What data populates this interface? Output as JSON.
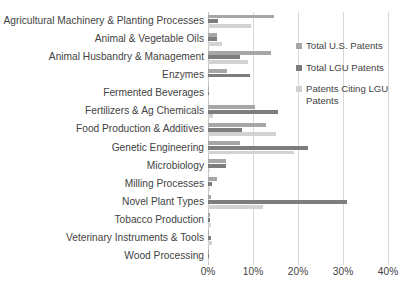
{
  "chart_data": {
    "type": "bar",
    "orientation": "horizontal",
    "title": "",
    "xlabel": "",
    "ylabel": "",
    "xlim": [
      0,
      40
    ],
    "xunit": "%",
    "grid": true,
    "legend_position": "right",
    "xticks": [
      "0%",
      "10%",
      "20%",
      "30%",
      "40%"
    ],
    "xtick_values": [
      0,
      10,
      20,
      30,
      40
    ],
    "categories": [
      "Agricultural Machinery & Planting Processes",
      "Animal & Vegetable Oils",
      "Animal Husbandry & Management",
      "Enzymes",
      "Fermented Beverages",
      "Fertilizers & Ag Chemicals",
      "Food Production & Additives",
      "Genetic Engineering",
      "Microbiology",
      "Milling Processes",
      "Novel Plant Types",
      "Tobacco Production",
      "Veterinary Instruments & Tools",
      "Wood Processing"
    ],
    "series": [
      {
        "name": "Total U.S. Patents",
        "color": "#a6a6a6",
        "values": [
          14.6,
          2.0,
          14.0,
          4.2,
          0.2,
          10.4,
          12.8,
          7.1,
          4.0,
          2.0,
          0.6,
          0.5,
          0.3,
          0.2
        ]
      },
      {
        "name": "Total LGU Patents",
        "color": "#7d7d7d",
        "values": [
          2.3,
          1.9,
          7.2,
          9.4,
          0.1,
          15.6,
          7.5,
          22.2,
          4.0,
          0.8,
          30.9,
          0.5,
          0.6,
          0.1
        ]
      },
      {
        "name": "Patents Citing LGU Patents",
        "color": "#d2d2d2",
        "values": [
          9.6,
          3.0,
          8.8,
          0.3,
          0.2,
          1.0,
          15.2,
          19.0,
          0.4,
          0.5,
          12.2,
          0.7,
          0.8,
          0.1
        ]
      }
    ]
  },
  "legend": {
    "items": [
      {
        "label": "Total U.S. Patents"
      },
      {
        "label": "Total LGU Patents"
      },
      {
        "label": "Patents Citing LGU Patents"
      }
    ]
  }
}
